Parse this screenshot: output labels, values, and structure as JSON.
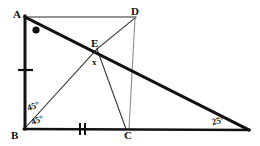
{
  "figure": {
    "kind": "geometry-diagram",
    "width": 260,
    "height": 146,
    "stroke_color": "#111111",
    "thin_stroke_color": "#555555",
    "background": "#ffffff",
    "points": {
      "A": {
        "x": 24,
        "y": 17,
        "label": "A",
        "label_x": 12,
        "label_y": 10
      },
      "B": {
        "x": 24,
        "y": 129,
        "label": "B",
        "label_x": 12,
        "label_y": 131
      },
      "C": {
        "x": 128,
        "y": 129,
        "label": "C",
        "label_x": 124,
        "label_y": 131
      },
      "D": {
        "x": 135,
        "y": 17,
        "label": "D",
        "label_x": 133,
        "label_y": 9
      },
      "E": {
        "x": 97,
        "y": 49,
        "label": "E",
        "label_x": 92,
        "label_y": 40
      },
      "F": {
        "x": 248,
        "y": 130,
        "label": "",
        "label_x": 0,
        "label_y": 0
      }
    },
    "segments": [
      {
        "name": "segment-AD",
        "from": "A",
        "to": "D",
        "weight": "thin"
      },
      {
        "name": "segment-AB",
        "from": "A",
        "to": "B",
        "weight": "thick"
      },
      {
        "name": "segment-BF",
        "from": "B",
        "to": "F",
        "weight": "thick"
      },
      {
        "name": "segment-AF",
        "from": "A",
        "to": "F",
        "weight": "thick"
      },
      {
        "name": "segment-BE",
        "from": "B",
        "to": "E",
        "weight": "thin"
      },
      {
        "name": "segment-EC",
        "from": "E",
        "to": "C",
        "weight": "thin"
      },
      {
        "name": "segment-ED",
        "from": "E",
        "to": "D",
        "weight": "thin"
      },
      {
        "name": "segment-DC",
        "from": "D",
        "to": "C",
        "weight": "thin"
      }
    ],
    "tick_marks": [
      {
        "name": "tick-AB",
        "on": "segment-AB",
        "count": 1,
        "t": 0.46
      },
      {
        "name": "tick-BC",
        "on": "segment-BC",
        "count": 2,
        "t": 0.55
      }
    ],
    "angle_markers": [
      {
        "name": "angle-dot-A",
        "at": "A",
        "style": "filled-dot"
      }
    ],
    "labels": {
      "angle_b_upper": "45°",
      "angle_b_lower": "45°",
      "angle_e": "x",
      "angle_f": "25°"
    }
  }
}
